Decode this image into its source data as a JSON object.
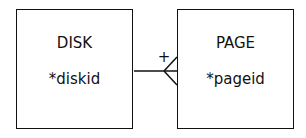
{
  "entities": [
    {
      "name": "DISK",
      "attributes": [
        "*diskid"
      ]
    },
    {
      "name": "PAGE",
      "attributes": [
        "*pageid"
      ]
    }
  ],
  "relationship": {
    "from": "DISK",
    "to": "PAGE",
    "from_cardinality": "one (+)",
    "to_cardinality": "many (crow's foot)",
    "marker": "+"
  }
}
